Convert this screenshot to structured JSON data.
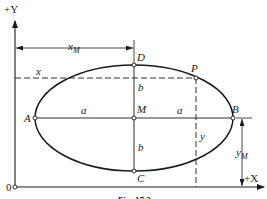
{
  "diagram": {
    "type": "geometric-figure",
    "axes": {
      "x_label": "+X",
      "y_label": "+Y",
      "origin_label": "0"
    },
    "points": {
      "A": "A",
      "B": "B",
      "C": "C",
      "D": "D",
      "M": "M",
      "P": "P"
    },
    "dimensions": {
      "semi_major_left": "a",
      "semi_major_right": "a",
      "semi_minor_top": "b",
      "semi_minor_bottom": "b",
      "x_coord": "x",
      "y_coord": "y",
      "x_center": "x",
      "x_center_sub": "M",
      "y_center": "y",
      "y_center_sub": "M"
    },
    "caption": "Fig. 17.3",
    "colors": {
      "stroke": "#1a1a1a",
      "background": "#ffffff"
    }
  }
}
